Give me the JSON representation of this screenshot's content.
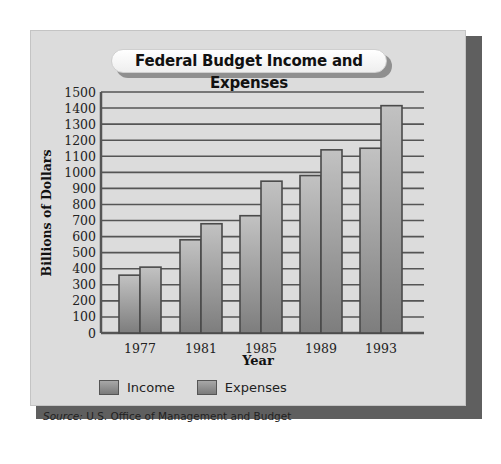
{
  "chart_data": {
    "type": "bar",
    "title": "Federal Budget Income and Expenses",
    "xlabel": "Year",
    "ylabel": "Billions of Dollars",
    "categories": [
      "1977",
      "1981",
      "1985",
      "1989",
      "1993"
    ],
    "series": [
      {
        "name": "Income",
        "values": [
          360,
          580,
          730,
          980,
          1150
        ]
      },
      {
        "name": "Expenses",
        "values": [
          410,
          680,
          945,
          1140,
          1415
        ]
      }
    ],
    "ylim": [
      0,
      1500
    ],
    "yticks": [
      0,
      100,
      200,
      300,
      400,
      500,
      600,
      700,
      800,
      900,
      1000,
      1100,
      1200,
      1300,
      1400,
      1500
    ],
    "grid": true,
    "legend_position": "bottom-left",
    "colors": {
      "bar_light": "#c2c2c2",
      "bar_dark": "#7d7d7d",
      "bar_border": "#4a4a4a",
      "grid": "#555555"
    }
  },
  "legend": {
    "income_label": "Income",
    "expenses_label": "Expenses"
  },
  "source": {
    "prefix": "Source:",
    "text": " U.S. Office of Management and Budget"
  }
}
